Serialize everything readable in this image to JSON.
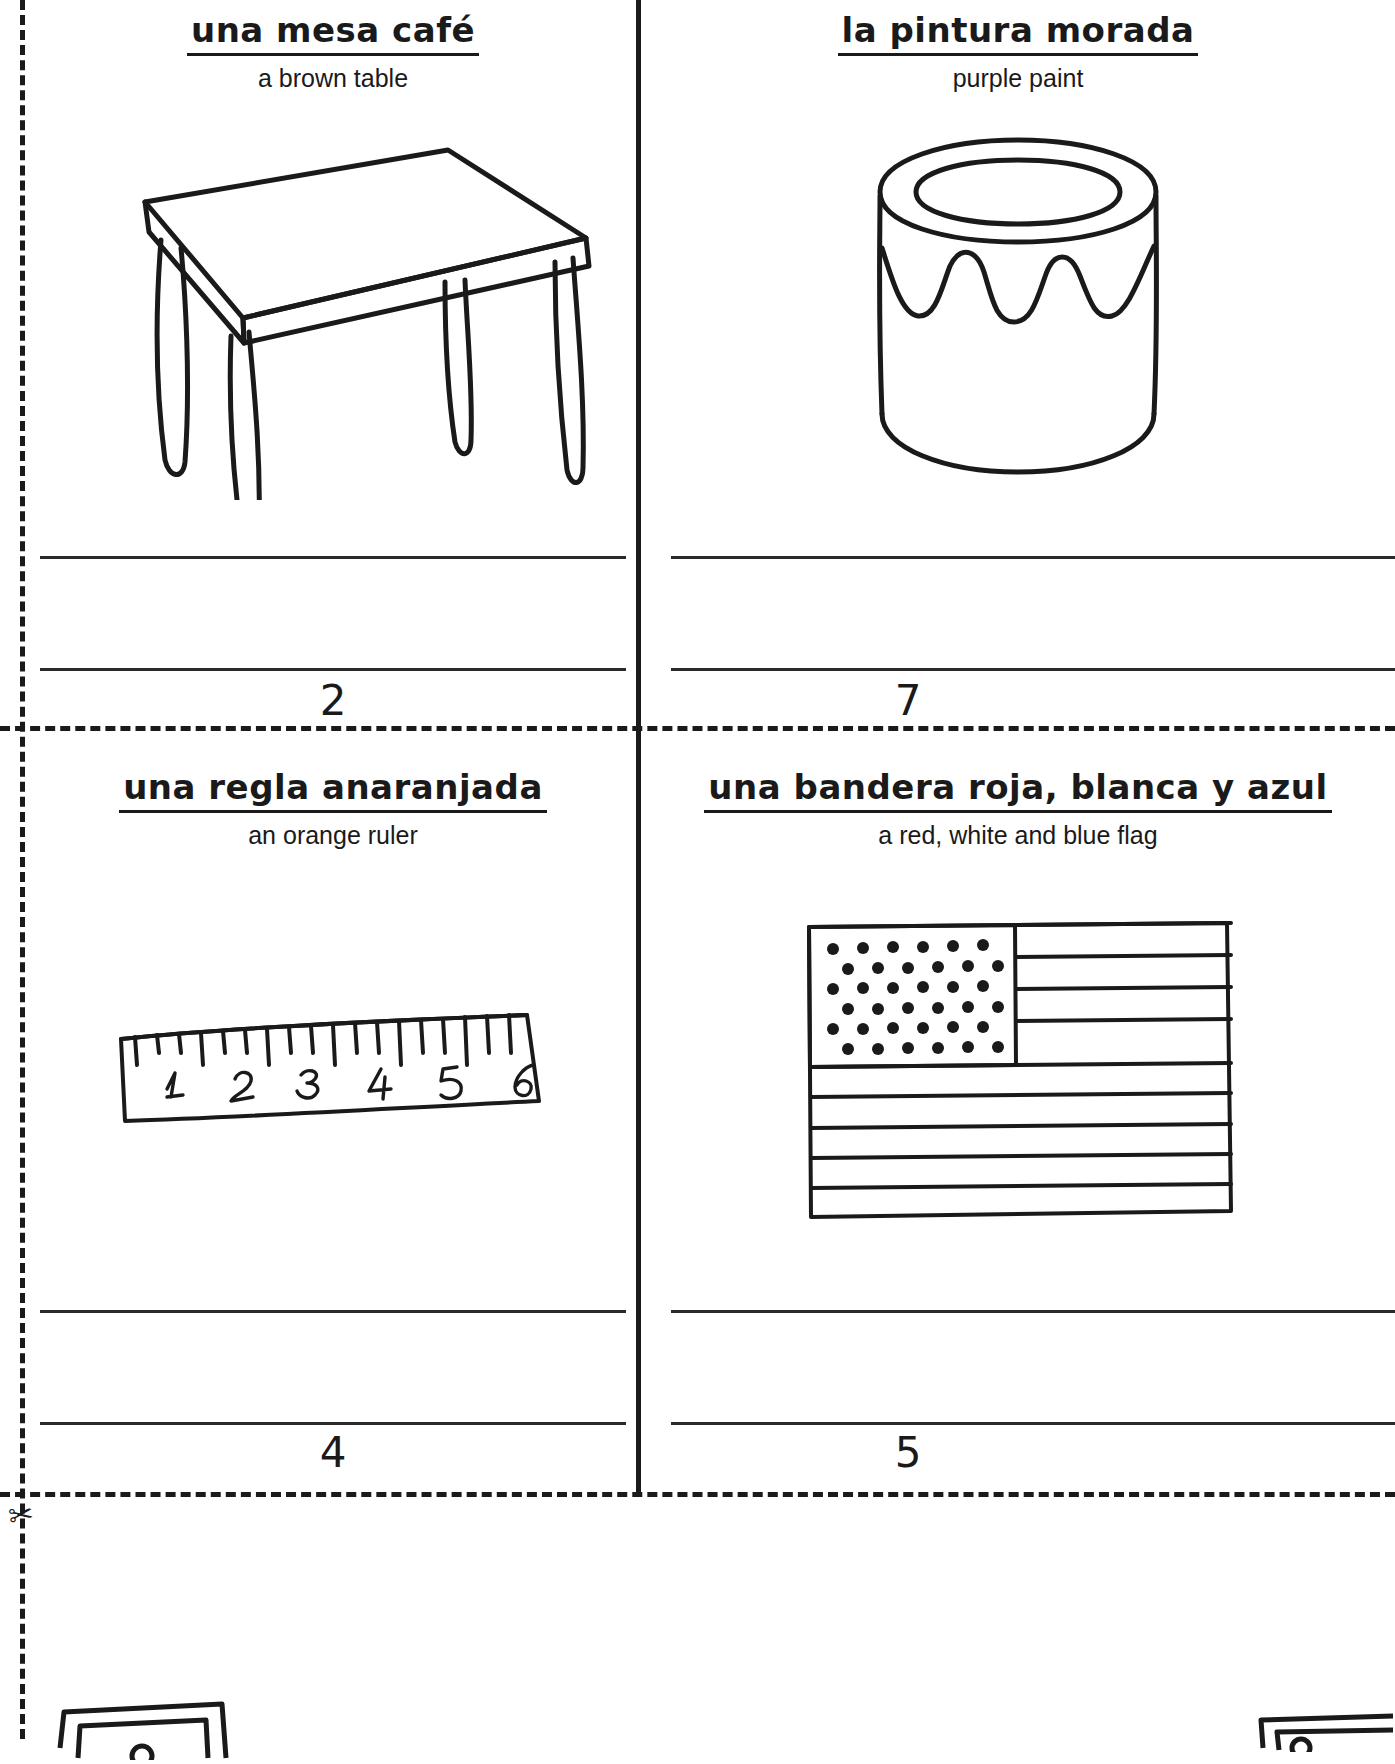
{
  "worksheet": {
    "type": "bilingual vocabulary cut-out flashcards",
    "cut_guide_style": "dashed",
    "scissors_icon": "scissors-icon",
    "ink_color": "#1a1a1a"
  },
  "cards": [
    {
      "id": "card-mesa",
      "term_es": "una mesa café",
      "term_en": "a brown table",
      "number": "2",
      "illustration": "table-illustration",
      "writing_lines": 2
    },
    {
      "id": "card-pintura",
      "term_es": "la pintura morada",
      "term_en": "purple paint",
      "number": "7",
      "illustration": "paint-can-illustration",
      "writing_lines": 2
    },
    {
      "id": "card-regla",
      "term_es": "una regla anaranjada",
      "term_en": "an orange ruler",
      "number": "4",
      "illustration": "ruler-illustration",
      "writing_lines": 2,
      "ruler_marks": [
        "1",
        "2",
        "3",
        "4",
        "5",
        "6"
      ]
    },
    {
      "id": "card-bandera",
      "term_es": "una bandera roja, blanca y azul",
      "term_en": "a red, white and blue flag",
      "number": "5",
      "illustration": "flag-illustration",
      "writing_lines": 2
    }
  ],
  "partial_cards": [
    {
      "id": "partial-bottom-left",
      "illustration": "partial-card-illustration"
    },
    {
      "id": "partial-bottom-right",
      "illustration": "partial-card-illustration"
    }
  ]
}
